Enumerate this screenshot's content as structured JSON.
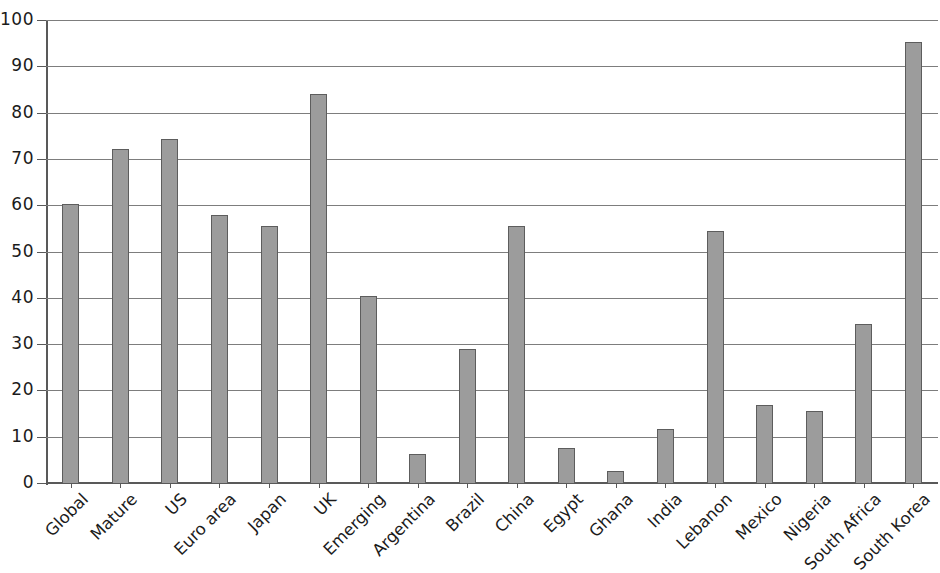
{
  "chart_data": {
    "type": "bar",
    "title": "",
    "subtitle": "",
    "xlabel": "",
    "ylabel": "",
    "ylim": [
      0,
      100
    ],
    "ytick_step": 10,
    "yticks": [
      0,
      10,
      20,
      30,
      40,
      50,
      60,
      70,
      80,
      90,
      100
    ],
    "ytick_labels": [
      "0",
      "10",
      "20",
      "30",
      "40",
      "50",
      "60",
      "70",
      "80",
      "90",
      "100"
    ],
    "grid": true,
    "grid_axis": "y",
    "legend": false,
    "legend_position": "none",
    "annotations": [],
    "bar_color": "#9c9c9c",
    "bar_edge_color": "#5d5d5d",
    "grid_color": "#7d7d7d",
    "axis_color": "#595959",
    "text_color": "#1b1b1b",
    "background_color": "#ffffff",
    "xtick_rotation": -45,
    "categories": [
      "Global",
      "Mature",
      "US",
      "Euro area",
      "Japan",
      "UK",
      "Emerging",
      "Argentina",
      "Brazil",
      "China",
      "Egypt",
      "Ghana",
      "India",
      "Lebanon",
      "Mexico",
      "Nigeria",
      "South Africa",
      "South Korea"
    ],
    "values": [
      60.3,
      72.2,
      74.3,
      57.8,
      55.4,
      84.0,
      40.4,
      6.3,
      29.0,
      55.5,
      7.5,
      2.6,
      11.7,
      54.5,
      16.8,
      15.6,
      34.3,
      95.2
    ]
  }
}
